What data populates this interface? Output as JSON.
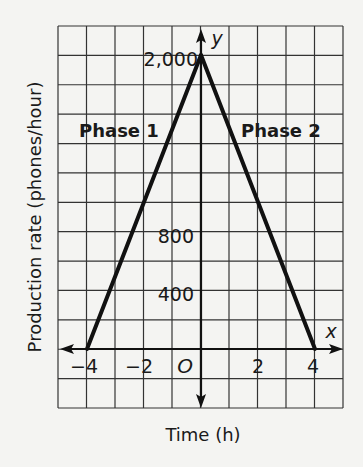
{
  "chart_data": {
    "type": "line",
    "title": "",
    "xlabel": "Time (h)",
    "ylabel": "Production rate (phones/hour)",
    "x_axis_name": "x",
    "y_axis_name": "y",
    "origin_label": "O",
    "x_ticks": [
      "-4",
      "-2",
      "2",
      "4"
    ],
    "x_tick_values": [
      -4,
      -2,
      2,
      4
    ],
    "y_ticks": [
      "400",
      "800",
      "2,000"
    ],
    "y_tick_values": [
      400,
      800,
      2000
    ],
    "xlim": [
      -5,
      5
    ],
    "ylim": [
      -400,
      2200
    ],
    "grid": true,
    "grid_x_step": 1,
    "grid_y_step": 200,
    "series": [
      {
        "name": "Phase 1",
        "x": [
          -4,
          0
        ],
        "y": [
          0,
          2000
        ]
      },
      {
        "name": "Phase 2",
        "x": [
          0,
          4
        ],
        "y": [
          2000,
          0
        ]
      }
    ],
    "annotations": [
      {
        "text": "Phase 1",
        "x": -3.2,
        "y": 1500
      },
      {
        "text": "Phase 2",
        "x": 2.3,
        "y": 1500
      }
    ]
  },
  "labels": {
    "xlabel": "Time (h)",
    "ylabel": "Production rate (phones/hour)",
    "x_axis": "x",
    "y_axis": "y",
    "origin": "O",
    "xt_m4": "−4",
    "xt_m2": "−2",
    "xt_2": "2",
    "xt_4": "4",
    "yt_400": "400",
    "yt_800": "800",
    "yt_2000": "2,000",
    "phase1": "Phase 1",
    "phase2": "Phase 2"
  }
}
